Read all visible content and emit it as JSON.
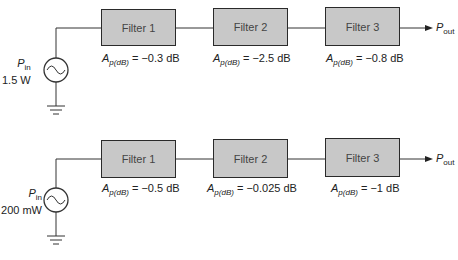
{
  "rows": [
    {
      "source": {
        "symbol": "P",
        "subscript": "in",
        "value": "1.5 W"
      },
      "filters": [
        {
          "label": "Filter 1",
          "gain_symbol": "A",
          "gain_subscript": "p(dB)",
          "gain_value": "= −0.3 dB"
        },
        {
          "label": "Filter 2",
          "gain_symbol": "A",
          "gain_subscript": "p(dB)",
          "gain_value": "= −2.5 dB"
        },
        {
          "label": "Filter 3",
          "gain_symbol": "A",
          "gain_subscript": "p(dB)",
          "gain_value": "= −0.8 dB"
        }
      ],
      "output": {
        "symbol": "P",
        "subscript": "out"
      }
    },
    {
      "source": {
        "symbol": "P",
        "subscript": "in",
        "value": "200 mW"
      },
      "filters": [
        {
          "label": "Filter 1",
          "gain_symbol": "A",
          "gain_subscript": "p(dB)",
          "gain_value": "= −0.5 dB"
        },
        {
          "label": "Filter 2",
          "gain_symbol": "A",
          "gain_subscript": "p(dB)",
          "gain_value": "= −0.025 dB"
        },
        {
          "label": "Filter 3",
          "gain_symbol": "A",
          "gain_subscript": "p(dB)",
          "gain_value": "= −1 dB"
        }
      ],
      "output": {
        "symbol": "P",
        "subscript": "out"
      }
    }
  ],
  "colors": {
    "filter_fill": "#c8c8c8",
    "line": "#2a2a2a"
  }
}
